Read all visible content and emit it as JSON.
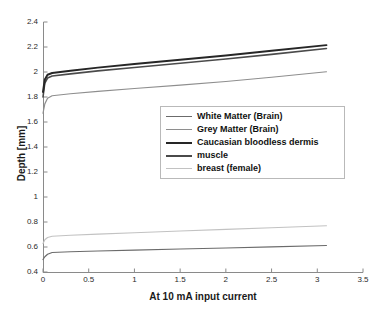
{
  "chart_data": {
    "type": "line",
    "title": "",
    "subtitle": "",
    "xlabel": "At 10 mA input current",
    "ylabel": "Depth [mm]",
    "xlim": [
      0,
      3.5
    ],
    "ylim": [
      0.4,
      2.4
    ],
    "xticks": [
      "0",
      "0.5",
      "1",
      "1.5",
      "2",
      "2.5",
      "3",
      "3.5"
    ],
    "xtick_values": [
      0,
      0.5,
      1,
      1.5,
      2,
      2.5,
      3,
      3.5
    ],
    "yticks": [
      "0.4",
      "0.6",
      "0.8",
      "1",
      "1.2",
      "1.4",
      "1.6",
      "1.8",
      "2",
      "2.2",
      "2.4"
    ],
    "ytick_values": [
      0.4,
      0.6,
      0.8,
      1.0,
      1.2,
      1.4,
      1.6,
      1.8,
      2.0,
      2.2,
      2.4
    ],
    "grid": false,
    "legend_position": "center-right",
    "x": [
      0,
      0.02,
      0.05,
      0.1,
      0.3,
      0.6,
      1.0,
      1.5,
      2.0,
      2.5,
      3.1
    ],
    "series": [
      {
        "name": "White Matter (Brain)",
        "color": "#6b6b6b",
        "width": 1.2,
        "values": [
          0.5,
          0.522,
          0.542,
          0.556,
          0.562,
          0.568,
          0.575,
          0.584,
          0.592,
          0.601,
          0.612
        ]
      },
      {
        "name": "Grey Matter (Brain)",
        "color": "#8e8e8e",
        "width": 1.2,
        "values": [
          1.67,
          1.745,
          1.79,
          1.81,
          1.826,
          1.845,
          1.868,
          1.895,
          1.924,
          1.958,
          2.002
        ]
      },
      {
        "name": "Caucasian bloodless dermis",
        "color": "#262626",
        "width": 2.0,
        "values": [
          1.84,
          1.94,
          1.978,
          1.992,
          2.01,
          2.035,
          2.063,
          2.098,
          2.133,
          2.17,
          2.215
        ]
      },
      {
        "name": "muscle",
        "color": "#4a4a4a",
        "width": 1.6,
        "values": [
          1.8,
          1.912,
          1.952,
          1.968,
          1.985,
          2.009,
          2.036,
          2.07,
          2.104,
          2.141,
          2.188
        ]
      },
      {
        "name": "breast (female)",
        "color": "#c2c2c2",
        "width": 1.2,
        "values": [
          0.628,
          0.658,
          0.676,
          0.686,
          0.694,
          0.703,
          0.714,
          0.728,
          0.741,
          0.754,
          0.77
        ]
      }
    ]
  },
  "legend": {
    "items": [
      {
        "label": "White Matter (Brain)",
        "color": "#6b6b6b",
        "width": 1.2
      },
      {
        "label": "Grey Matter (Brain)",
        "color": "#8e8e8e",
        "width": 1.2
      },
      {
        "label": "Caucasian bloodless dermis",
        "color": "#262626",
        "width": 2.0
      },
      {
        "label": "muscle",
        "color": "#4a4a4a",
        "width": 1.6
      },
      {
        "label": "breast (female)",
        "color": "#c2c2c2",
        "width": 1.2
      }
    ]
  },
  "axes": {
    "y_title": "Depth [mm]",
    "x_title": "At 10 mA input current",
    "axis_color": "#8a8a8a",
    "tick_color": "#8a8a8a",
    "label_color": "#2b2b2b"
  },
  "plot_area": {
    "left": 43,
    "top": 22,
    "right": 363,
    "bottom": 272
  }
}
